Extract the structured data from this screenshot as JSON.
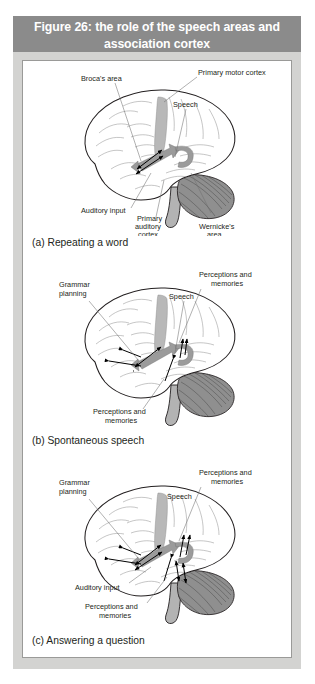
{
  "figure": {
    "title": "Figure 26: the role of the speech areas and association cortex",
    "title_line_1": "Figure 26: the role of the speech areas and",
    "title_line_2": "association cortex",
    "colors": {
      "title_bar": "#8b8b8b",
      "title_text": "#ffffff",
      "plate": "#d3d3d1",
      "content_background": "#ffffff",
      "content_border": "#9a9a98",
      "brain_outline": "#231f20",
      "motor_strip": "#b8b8b8",
      "pathway_band": "#9b9b9b",
      "cerebellum": "#8f8f8f",
      "brainstem": "#b3b3b3",
      "label_text": "#231f20",
      "leader_line": "#6f6f6f",
      "arrow": "#000000"
    }
  },
  "panels": [
    {
      "id": "a",
      "caption": "(a) Repeating a word",
      "labels": [
        {
          "name": "brocas-area",
          "text": "Broca's area"
        },
        {
          "name": "primary-motor-cortex",
          "text": "Primary motor cortex"
        },
        {
          "name": "speech",
          "text": "Speech"
        },
        {
          "name": "auditory-input",
          "text": "Auditory input"
        },
        {
          "name": "primary-auditory-cortex-l1",
          "text": "Primary"
        },
        {
          "name": "primary-auditory-cortex-l2",
          "text": "auditory"
        },
        {
          "name": "primary-auditory-cortex-l3",
          "text": "cortex"
        },
        {
          "name": "wernickes-area-l1",
          "text": "Wernicke's"
        },
        {
          "name": "wernickes-area-l2",
          "text": "area"
        }
      ]
    },
    {
      "id": "b",
      "caption": "(b) Spontaneous speech",
      "labels": [
        {
          "name": "grammar-planning-l1",
          "text": "Grammar"
        },
        {
          "name": "grammar-planning-l2",
          "text": "planning"
        },
        {
          "name": "perceptions-memories-top-l1",
          "text": "Perceptions and"
        },
        {
          "name": "perceptions-memories-top-l2",
          "text": "memories"
        },
        {
          "name": "speech",
          "text": "Speech"
        },
        {
          "name": "perceptions-memories-bottom-l1",
          "text": "Perceptions and"
        },
        {
          "name": "perceptions-memories-bottom-l2",
          "text": "memories"
        }
      ]
    },
    {
      "id": "c",
      "caption": "(c) Answering a question",
      "labels": [
        {
          "name": "grammar-planning-l1",
          "text": "Grammar"
        },
        {
          "name": "grammar-planning-l2",
          "text": "planning"
        },
        {
          "name": "perceptions-memories-top-l1",
          "text": "Perceptions and"
        },
        {
          "name": "perceptions-memories-top-l2",
          "text": "memories"
        },
        {
          "name": "speech",
          "text": "Speech"
        },
        {
          "name": "auditory-input",
          "text": "Auditory input"
        },
        {
          "name": "perceptions-memories-bottom-l1",
          "text": "Perceptions and"
        },
        {
          "name": "perceptions-memories-bottom-l2",
          "text": "memories"
        }
      ]
    }
  ]
}
